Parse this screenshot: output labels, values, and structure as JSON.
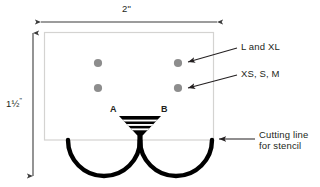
{
  "diagram": {
    "colors": {
      "sheet_border": "#d4d3d1",
      "sheet_fill": "#ffffff",
      "dot": "#8d8d8d",
      "dimension_line": "#3b3b3b",
      "cut_line": "#000000",
      "text": "#231f20"
    },
    "dimensions": {
      "width_label": "2\"",
      "height_label_whole": "1",
      "height_label_fraction": "½",
      "height_label_unit": "\"",
      "height_label_full": "1½\""
    },
    "markers": {
      "point_a_label": "A",
      "point_b_label": "B"
    },
    "callouts": [
      {
        "id": "large-sizes",
        "text": "L and XL"
      },
      {
        "id": "small-sizes",
        "text": "XS, S, M"
      },
      {
        "id": "cutting-line",
        "line1": "Cutting line",
        "line2": "for stencil"
      }
    ],
    "holes": [
      {
        "id": "hole-top-left",
        "size_group": "L and XL",
        "cx": 98,
        "cy": 63
      },
      {
        "id": "hole-top-right",
        "size_group": "L and XL",
        "cx": 178,
        "cy": 63
      },
      {
        "id": "hole-bottom-left",
        "size_group": "XS, S, M",
        "cx": 98,
        "cy": 88
      },
      {
        "id": "hole-bottom-right",
        "size_group": "XS, S, M",
        "cx": 178,
        "cy": 88
      }
    ]
  }
}
